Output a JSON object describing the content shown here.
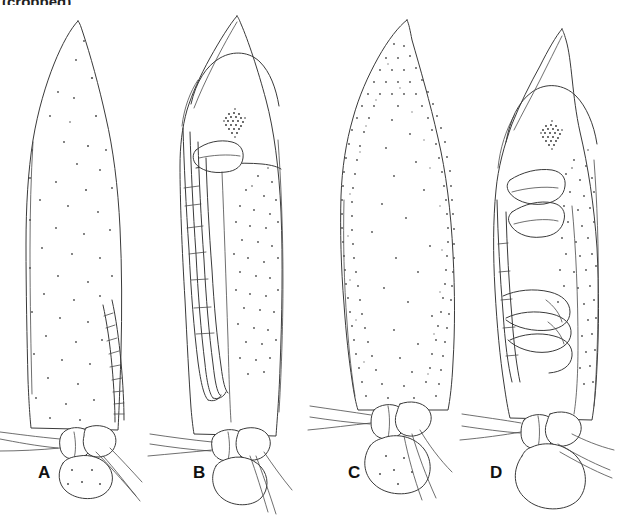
{
  "figure": {
    "type": "scientific-line-illustration",
    "background_color": "#ffffff",
    "ink_color": "#3a3a3a",
    "stipple_color": "#4d4d4d",
    "eye_patch_color": "#2a2a2a",
    "width_px": 617,
    "height_px": 518,
    "cropped_header_text": "(cropped)"
  },
  "panels": [
    {
      "id": "a",
      "label": "A",
      "label_x": 38,
      "label_y": 464,
      "description": "elongate pointed cocoon, sparse fine stipple, segmented antenna-like appendage along right margin, rounded basal sac with dots",
      "apex_x": 78,
      "apex_y": 20,
      "stipple_density": "sparse",
      "has_eye_patch": false,
      "has_segmented_appendage": true,
      "segment_count": 10
    },
    {
      "id": "b",
      "label": "B",
      "label_x": 193,
      "label_y": 464,
      "description": "pupa with pointed rostrum, dark stippled eye patch, wing pad, long slender leg appendages, stippling on right half of abdomen",
      "apex_x": 237,
      "apex_y": 15,
      "stipple_density": "medium",
      "has_eye_patch": true,
      "eye_x": 235,
      "eye_y": 120,
      "has_segmented_appendage": true,
      "segment_count": 6
    },
    {
      "id": "c",
      "label": "C",
      "label_x": 348,
      "label_y": 464,
      "description": "broadly ovate cocoon, dense marginal stippling throughout, broad rounded basal sac with crossing strands",
      "apex_x": 407,
      "apex_y": 19,
      "stipple_density": "dense",
      "has_eye_patch": false,
      "has_segmented_appendage": false
    },
    {
      "id": "d",
      "label": "D",
      "label_x": 490,
      "label_y": 464,
      "description": "stout pupa with pointed apex, star-like dark eye patch, folded leg appendages, large rounded basal sac",
      "apex_x": 562,
      "apex_y": 28,
      "stipple_density": "medium",
      "has_eye_patch": true,
      "eye_x": 552,
      "eye_y": 132,
      "has_segmented_appendage": true,
      "segment_count": 4
    }
  ]
}
